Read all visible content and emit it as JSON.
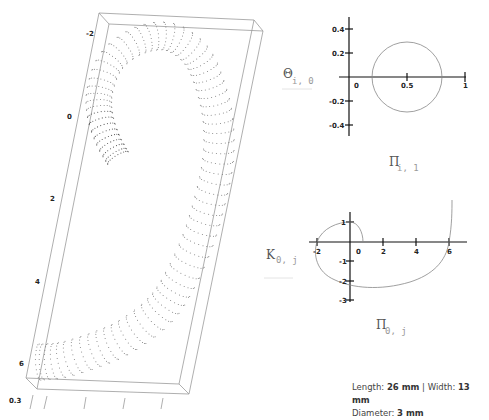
{
  "chart_data": [
    {
      "type": "scatter",
      "title": "3D dotted spiral tube (coiled)",
      "projection": "3d-box",
      "axis_ticks": [
        "-2",
        "0",
        "2",
        "4",
        "6"
      ],
      "depth_tick": "0.3",
      "box_color": "#999999",
      "point_color": "#666666"
    },
    {
      "type": "line",
      "title": "",
      "xlabel": "Π",
      "xlabel_sub": "i, 1",
      "ylabel": "Θ",
      "ylabel_sub": "i, 0",
      "x_ticks": [
        "0",
        "0.5",
        "1"
      ],
      "y_ticks": [
        "0.4",
        "0.2",
        "-0.2",
        "-0.4"
      ],
      "xlim": [
        0,
        1
      ],
      "ylim": [
        -0.45,
        0.45
      ],
      "series": [
        {
          "name": "circle",
          "center": [
            0.5,
            0
          ],
          "radius": 0.3
        }
      ]
    },
    {
      "type": "line",
      "title": "",
      "xlabel": "Π",
      "xlabel_sub": "0, j",
      "ylabel": "K",
      "ylabel_sub": "0, j",
      "x_ticks": [
        "-2",
        "0",
        "2",
        "4",
        "6"
      ],
      "y_ticks": [
        "1",
        "-1",
        "-2",
        "-3"
      ],
      "xlim": [
        -2.3,
        7
      ],
      "ylim": [
        -3,
        1.5
      ],
      "series": [
        {
          "name": "spiral",
          "x": [
            0.6,
            0.4,
            0,
            -1,
            -2,
            -2.2,
            -1.8,
            -1,
            0,
            1.5,
            3,
            4.5,
            5.5,
            6,
            6.2,
            6.2
          ],
          "y": [
            0,
            0.7,
            1.0,
            0.7,
            0,
            -1,
            -1.9,
            -2.4,
            -2.5,
            -2.5,
            -2.2,
            -1.5,
            -0.7,
            0,
            1,
            1.4
          ]
        }
      ]
    }
  ],
  "plot3d": {
    "ticks": [
      {
        "label": "-2",
        "x": 86,
        "y": 36
      },
      {
        "label": "0",
        "x": 67,
        "y": 119
      },
      {
        "label": "2",
        "x": 50,
        "y": 201
      },
      {
        "label": "4",
        "x": 35,
        "y": 284
      },
      {
        "label": "6",
        "x": 19,
        "y": 366
      },
      {
        "label": "0.3",
        "x": 9,
        "y": 400
      }
    ]
  },
  "plot_circle": {
    "ylabel": "Θ",
    "ylabel_sub": "i, 0",
    "xlabel": "Π",
    "xlabel_sub": "i, 1",
    "xticks": [
      "0",
      "0.5",
      "1"
    ],
    "yticks": [
      "0.4",
      "0.2",
      "-0.2",
      "-0.4"
    ]
  },
  "plot_spiral": {
    "ylabel": "K",
    "ylabel_sub": "0, j",
    "xlabel": "Π",
    "xlabel_sub": "0, j",
    "xticks": [
      "-2",
      "0",
      "2",
      "4",
      "6"
    ],
    "yticks": [
      "1",
      "-1",
      "-2",
      "-3"
    ]
  },
  "caption": {
    "length_label": "Length: ",
    "length_value": "26 mm",
    "separator": " | ",
    "width_label": "Width: ",
    "width_value": "13 mm",
    "diameter_label": "Diameter: ",
    "diameter_value": "3 mm"
  }
}
